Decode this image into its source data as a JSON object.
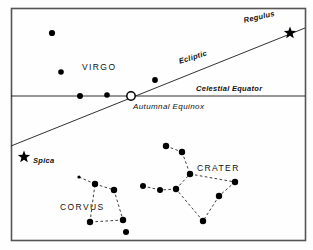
{
  "figure": {
    "border_color": "#555555",
    "line_color": "#1a1a1a",
    "star_color": "#000000",
    "background": "#fefefe"
  },
  "labels": {
    "virgo": "VIRGO",
    "corvus": "CORVUS",
    "crater": "CRATER",
    "regulus": "Regulus",
    "ecliptic": "Ecliptic",
    "celestial_equator": "Celestial Equator",
    "autumnal_equinox": "Autumnal Equinox",
    "spica": "Spica"
  },
  "chart_data": {
    "type": "scatter",
    "xlabel": "",
    "ylabel": "",
    "xlim": [
      11,
      305
    ],
    "ylim": [
      8,
      240
    ],
    "grid": false,
    "legend": "none",
    "frame": {
      "x": 11,
      "y": 8,
      "width": 294,
      "height": 232
    },
    "lines": [
      {
        "name": "celestial-equator",
        "label": "Celestial Equator",
        "style": "solid",
        "x1": 11,
        "y1": 96,
        "x2": 305,
        "y2": 96
      },
      {
        "name": "ecliptic",
        "label": "Ecliptic",
        "style": "solid",
        "x1": 11,
        "y1": 146,
        "x2": 305,
        "y2": 28
      }
    ],
    "markers": [
      {
        "name": "autumnal-equinox",
        "type": "open-circle",
        "x": 131,
        "y": 96,
        "r": 4.2
      },
      {
        "name": "regulus",
        "type": "star5",
        "x": 290,
        "y": 33,
        "r": 6.5
      },
      {
        "name": "spica",
        "type": "star5",
        "x": 24,
        "y": 157,
        "r": 6.5
      }
    ],
    "constellations": [
      {
        "name": "VIRGO",
        "label_x": 82,
        "label_y": 63,
        "stars": [
          {
            "x": 52,
            "y": 33,
            "r": 3.1
          },
          {
            "x": 61,
            "y": 72,
            "r": 2.8
          },
          {
            "x": 80,
            "y": 96,
            "r": 3.0
          },
          {
            "x": 107,
            "y": 95,
            "r": 2.8
          },
          {
            "x": 155,
            "y": 80,
            "r": 2.9
          }
        ],
        "links": []
      },
      {
        "name": "CORVUS",
        "label_x": 60,
        "label_y": 203,
        "stars": [
          {
            "x": 95,
            "y": 184,
            "r": 3.2
          },
          {
            "x": 114,
            "y": 190,
            "r": 3.2
          },
          {
            "x": 90,
            "y": 222,
            "r": 3.2
          },
          {
            "x": 123,
            "y": 220,
            "r": 3.2
          },
          {
            "x": 126,
            "y": 232,
            "r": 3.0
          },
          {
            "x": 79,
            "y": 177,
            "r": 1.6
          }
        ],
        "links": [
          [
            5,
            0
          ],
          [
            0,
            1
          ],
          [
            1,
            3
          ],
          [
            3,
            2
          ],
          [
            2,
            0
          ]
        ]
      },
      {
        "name": "CRATER",
        "label_x": 197,
        "label_y": 164,
        "stars": [
          {
            "x": 166,
            "y": 146,
            "r": 3.2
          },
          {
            "x": 182,
            "y": 152,
            "r": 3.2
          },
          {
            "x": 190,
            "y": 174,
            "r": 3.2
          },
          {
            "x": 235,
            "y": 182,
            "r": 3.2
          },
          {
            "x": 219,
            "y": 196,
            "r": 3.2
          },
          {
            "x": 203,
            "y": 221,
            "r": 3.2
          },
          {
            "x": 176,
            "y": 189,
            "r": 3.2
          },
          {
            "x": 160,
            "y": 190,
            "r": 3.0
          },
          {
            "x": 143,
            "y": 186,
            "r": 3.0
          }
        ],
        "links": [
          [
            0,
            1
          ],
          [
            1,
            2
          ],
          [
            2,
            3
          ],
          [
            3,
            4
          ],
          [
            4,
            5
          ],
          [
            5,
            6
          ],
          [
            6,
            2
          ],
          [
            6,
            7
          ],
          [
            7,
            8
          ]
        ]
      }
    ]
  }
}
